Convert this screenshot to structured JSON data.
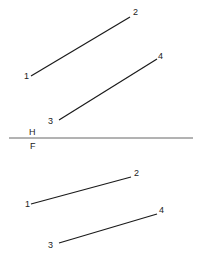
{
  "diagram": {
    "type": "orthographic-projection",
    "folding_line": {
      "label_above": "H",
      "label_below": "F",
      "x1": 9,
      "x2": 193,
      "y": 138
    },
    "top_view": {
      "lines": [
        {
          "name": "line-1-2",
          "start": {
            "label": "1",
            "x": 31,
            "y": 76
          },
          "end": {
            "label": "2",
            "x": 130,
            "y": 17
          }
        },
        {
          "name": "line-3-4",
          "start": {
            "label": "3",
            "x": 59,
            "y": 120
          },
          "end": {
            "label": "4",
            "x": 157,
            "y": 59
          }
        }
      ]
    },
    "front_view": {
      "lines": [
        {
          "name": "line-1-2",
          "start": {
            "label": "1",
            "x": 31,
            "y": 204
          },
          "end": {
            "label": "2",
            "x": 131,
            "y": 177
          }
        },
        {
          "name": "line-3-4",
          "start": {
            "label": "3",
            "x": 59,
            "y": 243
          },
          "end": {
            "label": "4",
            "x": 157,
            "y": 214
          }
        }
      ]
    }
  }
}
